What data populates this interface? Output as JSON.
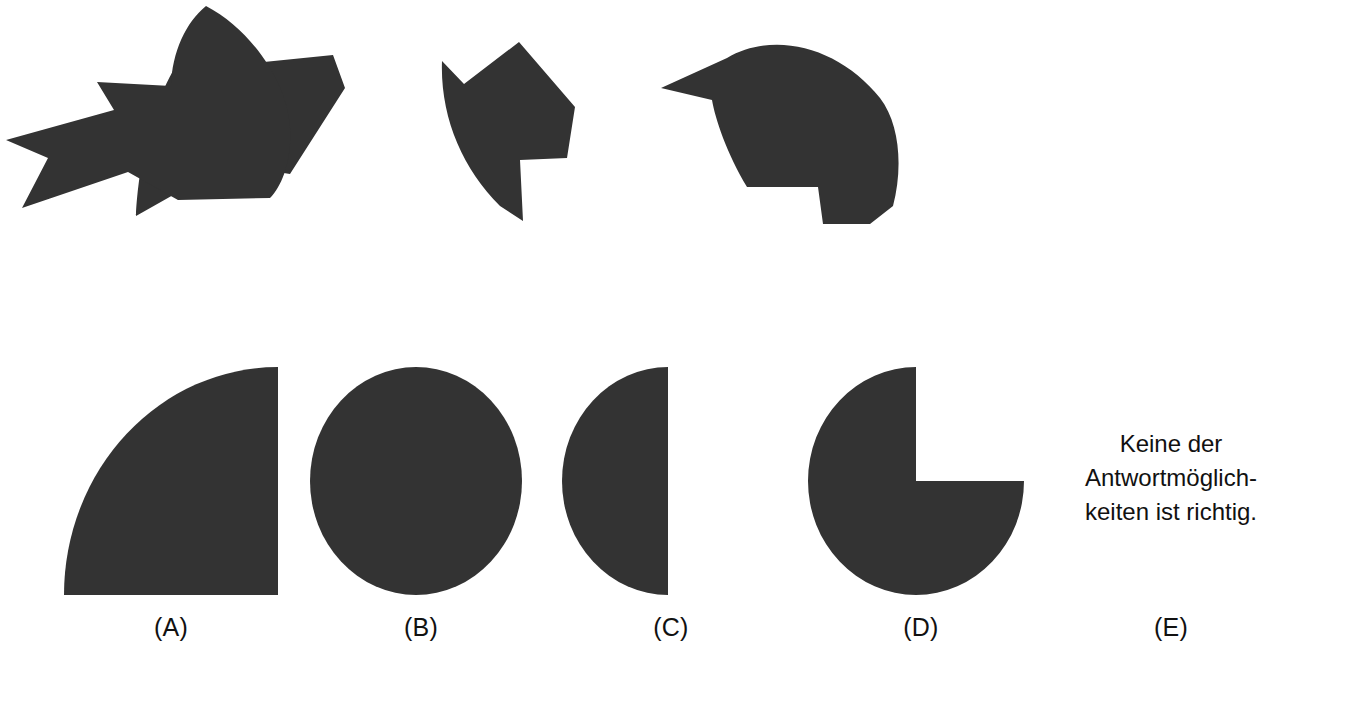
{
  "item": {
    "type": "figure-assembly",
    "language": "de",
    "fill_color": "#333333",
    "background_color": "#ffffff",
    "piece_count": 4,
    "option_count": 5
  },
  "pieces": [
    {
      "id": "piece-1",
      "name": "puzzle-piece-1",
      "description": "large angular wedge with curved lower-left edge and notch on lower right"
    },
    {
      "id": "piece-2",
      "name": "puzzle-piece-2",
      "description": "curved left edge fragment with step notch at bottom right and small notch top left"
    },
    {
      "id": "piece-3",
      "name": "puzzle-piece-3",
      "description": "broad arc band with concave inner corner and rectangular notch at bottom"
    },
    {
      "id": "piece-4",
      "name": "puzzle-piece-4",
      "description": "arrow-like fragment with curved right edge and pointed left tail"
    }
  ],
  "options": [
    {
      "label": "(A)",
      "letter": "A",
      "shape": "quarter-circle",
      "name": "answer-option-a",
      "text": ""
    },
    {
      "label": "(B)",
      "letter": "B",
      "shape": "full-circle",
      "name": "answer-option-b",
      "text": ""
    },
    {
      "label": "(C)",
      "letter": "C",
      "shape": "half-circle",
      "name": "answer-option-c",
      "text": ""
    },
    {
      "label": "(D)",
      "letter": "D",
      "shape": "three-quarter-circle",
      "name": "answer-option-d",
      "text": ""
    },
    {
      "label": "(E)",
      "letter": "E",
      "shape": "text",
      "name": "answer-option-e",
      "text": "Keine der\nAntwortmöglich-\nkeiten ist richtig."
    }
  ]
}
